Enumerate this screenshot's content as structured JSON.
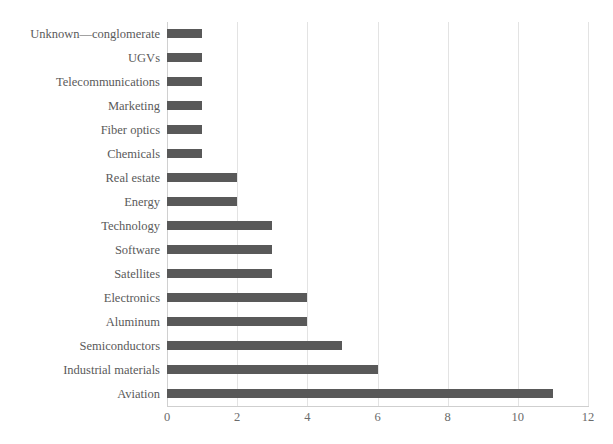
{
  "chart": {
    "title": "",
    "title_visible_fragment": ""
  },
  "chart_data": {
    "type": "bar",
    "orientation": "horizontal",
    "title": "",
    "xlabel": "",
    "ylabel": "",
    "xlim": [
      0,
      12
    ],
    "xticks": [
      "0",
      "2",
      "4",
      "6",
      "8",
      "10",
      "12"
    ],
    "xtick_values": [
      0,
      2,
      4,
      6,
      8,
      10,
      12
    ],
    "grid": "vertical",
    "legend": "none",
    "bar_color": "#595959",
    "categories": [
      "Unknown—conglomerate",
      "UGVs",
      "Telecommunications",
      "Marketing",
      "Fiber optics",
      "Chemicals",
      "Real estate",
      "Energy",
      "Technology",
      "Software",
      "Satellites",
      "Electronics",
      "Aluminum",
      "Semiconductors",
      "Industrial materials",
      "Aviation"
    ],
    "values": [
      1,
      1,
      1,
      1,
      1,
      1,
      2,
      2,
      3,
      3,
      3,
      4,
      4,
      5,
      6,
      11
    ]
  }
}
